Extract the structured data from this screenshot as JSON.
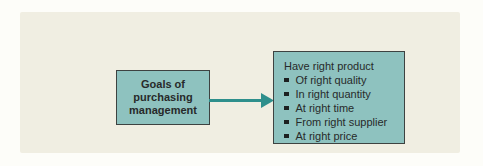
{
  "diagram": {
    "left_box": {
      "lines": [
        "Goals of",
        "purchasing",
        "management"
      ]
    },
    "arrow": {
      "direction": "right",
      "from": "left_box",
      "to": "right_box"
    },
    "right_box": {
      "title": "Have right product",
      "bullets": [
        "Of right quality",
        "In right quantity",
        "At right time",
        "From right supplier",
        "At right price"
      ]
    },
    "colors": {
      "page_bg": "#fdfdf9",
      "panel_bg": "#f0eee2",
      "box_fill": "#8ec2bf",
      "box_border": "#3d4241",
      "arrow": "#2e8f8c",
      "text": "#272a2a",
      "bullet": "#1c1f1f"
    }
  }
}
